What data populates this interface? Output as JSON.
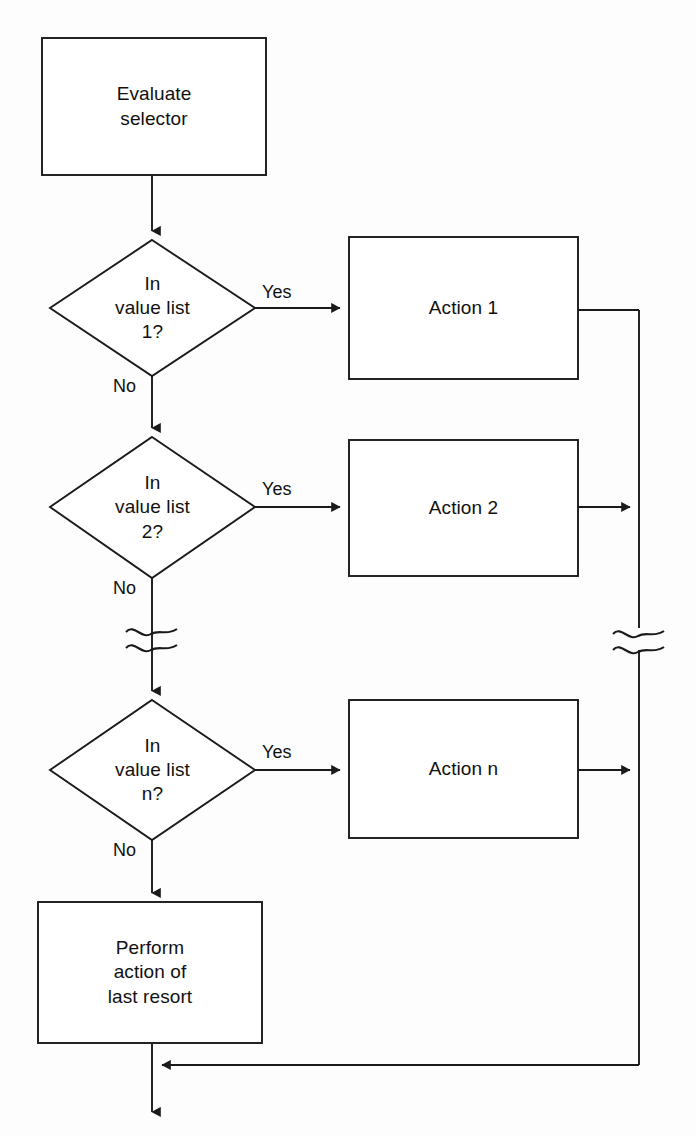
{
  "diagram": {
    "type": "flowchart",
    "background_color": "#fdfdfd",
    "stroke_color": "#1a1a1a",
    "text_color": "#111111",
    "nodes": [
      {
        "id": "evaluate-selector",
        "shape": "process",
        "label": "Evaluate\nselector",
        "x": 42,
        "y": 38,
        "w": 224,
        "h": 137
      },
      {
        "id": "decision-1",
        "shape": "decision",
        "label": "In\nvalue list\n1?",
        "x": 50,
        "y": 240,
        "w": 205,
        "h": 136
      },
      {
        "id": "action-1",
        "shape": "process",
        "label": "Action 1",
        "x": 349,
        "y": 237,
        "w": 229,
        "h": 142
      },
      {
        "id": "decision-2",
        "shape": "decision",
        "label": "In\nvalue list\n2?",
        "x": 50,
        "y": 437,
        "w": 205,
        "h": 141
      },
      {
        "id": "action-2",
        "shape": "process",
        "label": "Action 2",
        "x": 349,
        "y": 440,
        "w": 229,
        "h": 136
      },
      {
        "id": "decision-n",
        "shape": "decision",
        "label": "In\nvalue list\nn?",
        "x": 50,
        "y": 700,
        "w": 205,
        "h": 140
      },
      {
        "id": "action-n",
        "shape": "process",
        "label": "Action n",
        "x": 349,
        "y": 700,
        "w": 229,
        "h": 138
      },
      {
        "id": "last-resort",
        "shape": "process",
        "label": "Perform\naction of\nlast resort",
        "x": 38,
        "y": 902,
        "w": 224,
        "h": 141
      }
    ],
    "edge_labels": [
      {
        "id": "yes-1",
        "text": "Yes",
        "x": 262,
        "y": 283
      },
      {
        "id": "no-1",
        "text": "No",
        "x": 113,
        "y": 377
      },
      {
        "id": "yes-2",
        "text": "Yes",
        "x": 262,
        "y": 480
      },
      {
        "id": "no-2",
        "text": "No",
        "x": 113,
        "y": 579
      },
      {
        "id": "yes-n",
        "text": "Yes",
        "x": 262,
        "y": 743
      },
      {
        "id": "no-n",
        "text": "No",
        "x": 113,
        "y": 841
      }
    ],
    "break_marks": [
      {
        "id": "break-left",
        "x": 152,
        "y": 636
      },
      {
        "id": "break-right",
        "x": 639,
        "y": 638
      }
    ],
    "return_bus": {
      "x": 639,
      "top_y": 310,
      "bottom_y": 1065,
      "merge_x": 152,
      "exit_y": 1112
    }
  }
}
